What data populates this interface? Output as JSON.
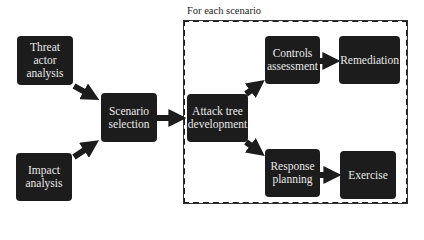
{
  "diagram": {
    "frame": {
      "label": "For each scenario"
    },
    "nodes": {
      "threat_actor": "Threat actor analysis",
      "impact": "Impact analysis",
      "scenario_selection": "Scenario selection",
      "attack_tree": "Attack tree development",
      "controls": "Controls assessment",
      "remediation": "Remediation",
      "response": "Response planning",
      "exercise": "Exercise"
    },
    "edges": [
      [
        "threat_actor",
        "scenario_selection"
      ],
      [
        "impact",
        "scenario_selection"
      ],
      [
        "scenario_selection",
        "attack_tree"
      ],
      [
        "attack_tree",
        "controls"
      ],
      [
        "attack_tree",
        "response"
      ],
      [
        "controls",
        "remediation"
      ],
      [
        "response",
        "exercise"
      ]
    ],
    "colors": {
      "box": "#1c1c1c",
      "text": "#e8e8e8",
      "background": "#ffffff"
    }
  }
}
